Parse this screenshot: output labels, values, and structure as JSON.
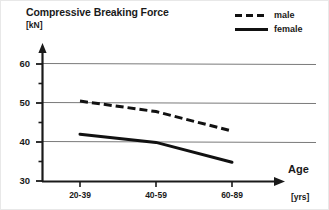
{
  "chart_data": {
    "type": "line",
    "title": "Compressive Breaking Force",
    "ylabel": "[kN]",
    "xlabel": "Age",
    "x_unit": "[yrs]",
    "categories": [
      "20-39",
      "40-59",
      "60-89"
    ],
    "yticks": [
      30,
      40,
      50,
      60
    ],
    "ytick_labels": [
      "30",
      "40",
      "50",
      "60"
    ],
    "yminor_ticks": [
      35,
      45,
      55
    ],
    "ylim": [
      30,
      62
    ],
    "grid": "horizontal",
    "gridlines": [
      40,
      50,
      60
    ],
    "legend_position": "top-right",
    "series": [
      {
        "name": "male",
        "style": "dashed",
        "color": "#111111",
        "values": [
          50.5,
          47.8,
          42.8
        ]
      },
      {
        "name": "female",
        "style": "solid",
        "color": "#111111",
        "values": [
          42.0,
          39.9,
          34.8
        ]
      }
    ],
    "annotations": []
  },
  "legend": {
    "items": [
      {
        "label": "male",
        "style": "dashed"
      },
      {
        "label": "female",
        "style": "solid"
      }
    ]
  },
  "axes": {
    "y_arrow": true,
    "x_arrow": true
  }
}
